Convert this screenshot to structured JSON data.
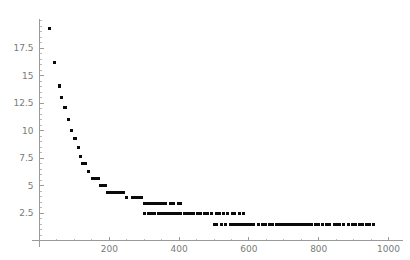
{
  "chart_data": {
    "type": "scatter",
    "title": "",
    "subtitle": "",
    "xlabel": "",
    "ylabel": "",
    "xlim": [
      0,
      1040
    ],
    "ylim": [
      0,
      20.2
    ],
    "grid": false,
    "legend": null,
    "marker": {
      "shape": "square",
      "color": "#0a0a0a",
      "size_px": 3
    },
    "axis_color": "#9a9a9a",
    "tick_label_color": "#7a7a7a",
    "x_ticks": [
      200,
      400,
      600,
      800,
      1000
    ],
    "x_tick_labels": [
      "200",
      "400",
      "600",
      "800",
      "1000"
    ],
    "x_minor_step": 50,
    "y_ticks": [
      2.5,
      5,
      7.5,
      10,
      12.5,
      15,
      17.5
    ],
    "y_tick_labels": [
      "2.5",
      "5",
      "7.5",
      "10",
      "12.5",
      "15",
      "17.5"
    ],
    "y_minor_step": 0.5,
    "points": [
      [
        30,
        19.3
      ],
      [
        42,
        16.2
      ],
      [
        56,
        14.1
      ],
      [
        58,
        14.0
      ],
      [
        64,
        13.0
      ],
      [
        72,
        12.1
      ],
      [
        75,
        12.1
      ],
      [
        82,
        11.0
      ],
      [
        92,
        10.0
      ],
      [
        100,
        9.3
      ],
      [
        104,
        9.3
      ],
      [
        112,
        8.5
      ],
      [
        118,
        7.6
      ],
      [
        124,
        7.0
      ],
      [
        128,
        7.0
      ],
      [
        133,
        7.0
      ],
      [
        140,
        6.3
      ],
      [
        152,
        5.6
      ],
      [
        158,
        5.6
      ],
      [
        163,
        5.6
      ],
      [
        168,
        5.6
      ],
      [
        175,
        5.0
      ],
      [
        182,
        5.0
      ],
      [
        188,
        5.0
      ],
      [
        196,
        4.4
      ],
      [
        204,
        4.4
      ],
      [
        210,
        4.4
      ],
      [
        216,
        4.4
      ],
      [
        224,
        4.4
      ],
      [
        232,
        4.4
      ],
      [
        240,
        4.4
      ],
      [
        250,
        3.9
      ],
      [
        266,
        3.9
      ],
      [
        272,
        3.9
      ],
      [
        278,
        3.9
      ],
      [
        284,
        3.9
      ],
      [
        292,
        3.9
      ],
      [
        300,
        3.4
      ],
      [
        306,
        3.4
      ],
      [
        312,
        3.4
      ],
      [
        318,
        3.4
      ],
      [
        324,
        3.4
      ],
      [
        330,
        3.4
      ],
      [
        336,
        3.4
      ],
      [
        344,
        3.4
      ],
      [
        352,
        3.4
      ],
      [
        362,
        3.4
      ],
      [
        374,
        3.4
      ],
      [
        384,
        3.4
      ],
      [
        398,
        3.4
      ],
      [
        404,
        3.4
      ],
      [
        300,
        2.5
      ],
      [
        312,
        2.5
      ],
      [
        322,
        2.5
      ],
      [
        330,
        2.5
      ],
      [
        340,
        2.5
      ],
      [
        348,
        2.5
      ],
      [
        356,
        2.5
      ],
      [
        362,
        2.5
      ],
      [
        370,
        2.5
      ],
      [
        378,
        2.5
      ],
      [
        386,
        2.5
      ],
      [
        396,
        2.5
      ],
      [
        404,
        2.5
      ],
      [
        414,
        2.5
      ],
      [
        424,
        2.5
      ],
      [
        432,
        2.5
      ],
      [
        440,
        2.5
      ],
      [
        452,
        2.5
      ],
      [
        462,
        2.5
      ],
      [
        472,
        2.5
      ],
      [
        480,
        2.5
      ],
      [
        492,
        2.5
      ],
      [
        506,
        2.5
      ],
      [
        516,
        2.5
      ],
      [
        526,
        2.5
      ],
      [
        540,
        2.5
      ],
      [
        552,
        2.5
      ],
      [
        560,
        2.5
      ],
      [
        572,
        2.5
      ],
      [
        584,
        2.5
      ],
      [
        500,
        1.5
      ],
      [
        506,
        1.5
      ],
      [
        520,
        1.5
      ],
      [
        534,
        1.5
      ],
      [
        548,
        1.5
      ],
      [
        556,
        1.5
      ],
      [
        562,
        1.5
      ],
      [
        570,
        1.5
      ],
      [
        578,
        1.5
      ],
      [
        586,
        1.5
      ],
      [
        596,
        1.5
      ],
      [
        604,
        1.5
      ],
      [
        614,
        1.5
      ],
      [
        626,
        1.5
      ],
      [
        638,
        1.5
      ],
      [
        648,
        1.5
      ],
      [
        660,
        1.5
      ],
      [
        668,
        1.5
      ],
      [
        678,
        1.5
      ],
      [
        688,
        1.5
      ],
      [
        696,
        1.5
      ],
      [
        706,
        1.5
      ],
      [
        714,
        1.5
      ],
      [
        722,
        1.5
      ],
      [
        730,
        1.5
      ],
      [
        740,
        1.5
      ],
      [
        748,
        1.5
      ],
      [
        756,
        1.5
      ],
      [
        764,
        1.5
      ],
      [
        772,
        1.5
      ],
      [
        780,
        1.5
      ],
      [
        790,
        1.5
      ],
      [
        800,
        1.5
      ],
      [
        810,
        1.5
      ],
      [
        822,
        1.5
      ],
      [
        832,
        1.5
      ],
      [
        844,
        1.5
      ],
      [
        852,
        1.5
      ],
      [
        860,
        1.5
      ],
      [
        872,
        1.5
      ],
      [
        886,
        1.5
      ],
      [
        898,
        1.5
      ],
      [
        906,
        1.5
      ],
      [
        916,
        1.5
      ],
      [
        926,
        1.5
      ],
      [
        936,
        1.5
      ],
      [
        946,
        1.5
      ],
      [
        956,
        1.5
      ]
    ]
  }
}
